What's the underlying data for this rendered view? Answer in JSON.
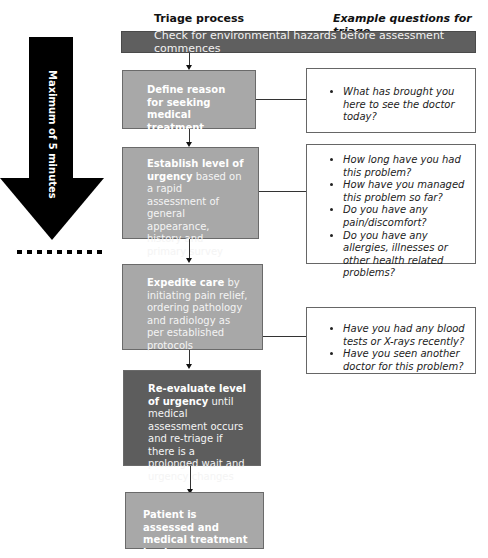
{
  "headers": {
    "left": "Triage process",
    "right": "Example questions for triage"
  },
  "timer_arrow": {
    "label": "Maximum of 5 minutes"
  },
  "top_bar": {
    "text": "Check for environmental hazards before assessment commences"
  },
  "steps": [
    {
      "bold": "Define reason for seeking medical treatment",
      "rest": ""
    },
    {
      "bold": "Establish level of urgency",
      "rest": " based on a rapid assessment of general appearance, history and primary survey"
    },
    {
      "bold": "Expedite care",
      "rest": " by initiating pain relief, ordering pathology and radiology as per established protocols"
    },
    {
      "bold": "Re-evaluate level of urgency",
      "rest": " until medical assessment occurs and re-triage if there is a prolonged wait and urgency changes"
    },
    {
      "bold": "Patient is assessed and medical treatment begins",
      "rest": ""
    }
  ],
  "questions": [
    {
      "items": [
        "What has brought you here to see the doctor today?"
      ]
    },
    {
      "items": [
        "How long have you had this problem?",
        "How have you managed this problem so far?",
        "Do you have any pain/discomfort?",
        "Do you have any allergies, illnesses or other health related problems?"
      ]
    },
    {
      "items": [
        "Have you had any blood tests or X-rays recently?",
        "Have you seen another doctor for this problem?"
      ]
    }
  ]
}
